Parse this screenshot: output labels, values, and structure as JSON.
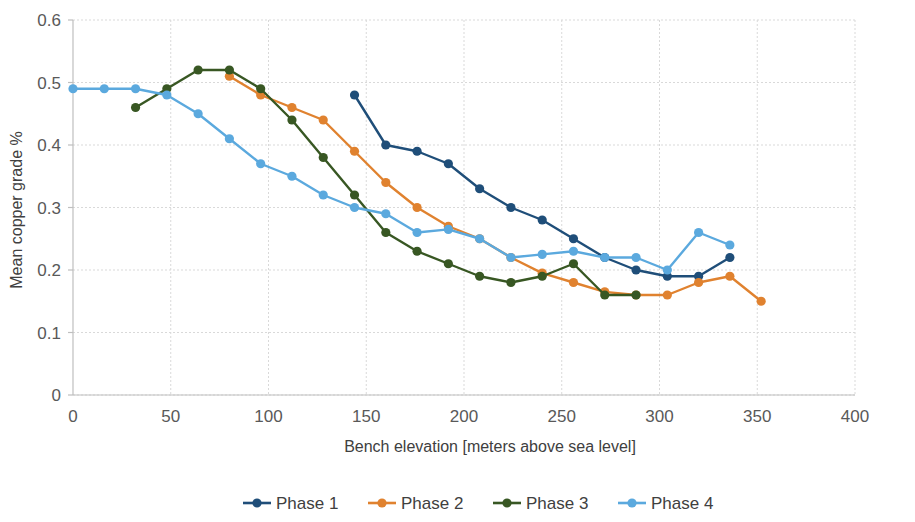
{
  "chart_data": {
    "type": "line",
    "title": "",
    "xlabel": "Bench elevation [meters above sea level]",
    "ylabel": "Mean copper grade %",
    "xlim": [
      0,
      400
    ],
    "ylim": [
      0,
      0.6
    ],
    "xticks": [
      "0",
      "50",
      "100",
      "150",
      "200",
      "250",
      "300",
      "350",
      "400"
    ],
    "xtick_values": [
      0,
      50,
      100,
      150,
      200,
      250,
      300,
      350,
      400
    ],
    "yticks": [
      "0",
      "0.1",
      "0.2",
      "0.3",
      "0.4",
      "0.5",
      "0.6"
    ],
    "ytick_values": [
      0,
      0.1,
      0.2,
      0.3,
      0.4,
      0.5,
      0.6
    ],
    "grid": true,
    "legend_position": "bottom",
    "series": [
      {
        "name": "Phase 1",
        "color": "#1F4E79",
        "x": [
          144,
          160,
          176,
          192,
          208,
          224,
          240,
          256,
          272,
          288,
          304,
          320,
          336
        ],
        "values": [
          0.48,
          0.4,
          0.39,
          0.37,
          0.33,
          0.3,
          0.28,
          0.25,
          0.22,
          0.2,
          0.19,
          0.19,
          0.22
        ]
      },
      {
        "name": "Phase 2",
        "color": "#E0822F",
        "x": [
          80,
          96,
          112,
          128,
          144,
          160,
          176,
          192,
          208,
          224,
          240,
          256,
          272,
          288,
          304,
          320,
          336,
          352
        ],
        "values": [
          0.51,
          0.48,
          0.46,
          0.44,
          0.39,
          0.34,
          0.3,
          0.27,
          0.25,
          0.22,
          0.195,
          0.18,
          0.165,
          0.16,
          0.16,
          0.18,
          0.19,
          0.15
        ]
      },
      {
        "name": "Phase 3",
        "color": "#385723",
        "x": [
          32,
          48,
          64,
          80,
          96,
          112,
          128,
          144,
          160,
          176,
          192,
          208,
          224,
          240,
          256,
          272,
          288
        ],
        "values": [
          0.46,
          0.49,
          0.52,
          0.52,
          0.49,
          0.44,
          0.38,
          0.32,
          0.26,
          0.23,
          0.21,
          0.19,
          0.18,
          0.19,
          0.21,
          0.16,
          0.16
        ]
      },
      {
        "name": "Phase 4",
        "color": "#5BA9DE",
        "x": [
          0,
          16,
          32,
          48,
          64,
          80,
          96,
          112,
          128,
          144,
          160,
          176,
          192,
          208,
          224,
          240,
          256,
          272,
          288,
          304,
          320,
          336
        ],
        "values": [
          0.49,
          0.49,
          0.49,
          0.48,
          0.45,
          0.41,
          0.37,
          0.35,
          0.32,
          0.3,
          0.29,
          0.26,
          0.265,
          0.25,
          0.22,
          0.225,
          0.23,
          0.22,
          0.22,
          0.2,
          0.26,
          0.24
        ]
      }
    ]
  },
  "legend": {
    "items": [
      {
        "label": "Phase 1",
        "color": "#1F4E79"
      },
      {
        "label": "Phase 2",
        "color": "#E0822F"
      },
      {
        "label": "Phase 3",
        "color": "#385723"
      },
      {
        "label": "Phase 4",
        "color": "#5BA9DE"
      }
    ]
  }
}
